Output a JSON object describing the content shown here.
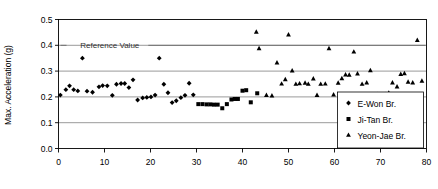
{
  "chart_data": {
    "type": "scatter",
    "title": "",
    "xlabel": "",
    "ylabel": "Max. Acceleration (g)",
    "xlim": [
      0,
      80
    ],
    "ylim": [
      0.0,
      0.5
    ],
    "xticks": [
      0,
      10,
      20,
      30,
      40,
      50,
      60,
      70,
      80
    ],
    "xtick_labels": [
      "0",
      "10",
      "20",
      "30",
      "40",
      "50",
      "60",
      "70",
      "80"
    ],
    "yticks": [
      0.0,
      0.1,
      0.2,
      0.3,
      0.4,
      0.5
    ],
    "ytick_labels": [
      "0.0",
      "0.1",
      "0.2",
      "0.3",
      "0.4",
      "0.5"
    ],
    "grid": "horizontal",
    "legend_position": "bottom-right",
    "annotations": [
      {
        "text": "Reference Value",
        "x": 3.0,
        "y": 0.4,
        "leader_to_x": 13.0,
        "leader_y": 0.4
      }
    ],
    "reference_lines": [
      {
        "label": "Reference Value",
        "y": 0.4
      }
    ],
    "series": [
      {
        "name": "E-Won Br.",
        "marker": "diamond",
        "color": "#000000",
        "points": [
          [
            0.4,
            0.207
          ],
          [
            1.6,
            0.228
          ],
          [
            2.4,
            0.243
          ],
          [
            3.3,
            0.228
          ],
          [
            4.2,
            0.223
          ],
          [
            5.2,
            0.35
          ],
          [
            6.2,
            0.222
          ],
          [
            7.4,
            0.218
          ],
          [
            8.8,
            0.239
          ],
          [
            9.6,
            0.244
          ],
          [
            10.6,
            0.243
          ],
          [
            11.7,
            0.206
          ],
          [
            12.6,
            0.249
          ],
          [
            13.6,
            0.252
          ],
          [
            14.4,
            0.252
          ],
          [
            15.3,
            0.236
          ],
          [
            16.2,
            0.266
          ],
          [
            17.2,
            0.188
          ],
          [
            18.3,
            0.196
          ],
          [
            19.2,
            0.198
          ],
          [
            20.1,
            0.2
          ],
          [
            21.0,
            0.207
          ],
          [
            21.9,
            0.35
          ],
          [
            22.9,
            0.249
          ],
          [
            23.8,
            0.216
          ],
          [
            24.7,
            0.178
          ],
          [
            25.6,
            0.185
          ],
          [
            26.6,
            0.197
          ],
          [
            27.5,
            0.206
          ],
          [
            28.4,
            0.253
          ],
          [
            29.3,
            0.208
          ]
        ]
      },
      {
        "name": "Ji-Tan Br.",
        "marker": "square",
        "color": "#000000",
        "points": [
          [
            30.4,
            0.172
          ],
          [
            31.3,
            0.172
          ],
          [
            32.2,
            0.171
          ],
          [
            33.0,
            0.171
          ],
          [
            33.8,
            0.17
          ],
          [
            34.6,
            0.17
          ],
          [
            35.6,
            0.156
          ],
          [
            36.6,
            0.172
          ],
          [
            37.6,
            0.19
          ],
          [
            38.3,
            0.192
          ],
          [
            39.0,
            0.192
          ],
          [
            40.0,
            0.224
          ],
          [
            40.8,
            0.226
          ],
          [
            41.8,
            0.179
          ],
          [
            43.2,
            0.214
          ]
        ]
      },
      {
        "name": "Yeon-Jae Br.",
        "marker": "triangle",
        "color": "#000000",
        "points": [
          [
            43.0,
            0.452
          ],
          [
            43.6,
            0.388
          ],
          [
            45.2,
            0.207
          ],
          [
            46.4,
            0.205
          ],
          [
            47.5,
            0.333
          ],
          [
            48.5,
            0.251
          ],
          [
            49.3,
            0.268
          ],
          [
            50.0,
            0.441
          ],
          [
            50.8,
            0.302
          ],
          [
            51.6,
            0.25
          ],
          [
            52.4,
            0.252
          ],
          [
            53.6,
            0.254
          ],
          [
            54.3,
            0.25
          ],
          [
            55.4,
            0.271
          ],
          [
            56.2,
            0.207
          ],
          [
            57.0,
            0.25
          ],
          [
            58.0,
            0.251
          ],
          [
            58.8,
            0.388
          ],
          [
            59.8,
            0.209
          ],
          [
            60.8,
            0.254
          ],
          [
            61.6,
            0.272
          ],
          [
            62.4,
            0.286
          ],
          [
            63.2,
            0.285
          ],
          [
            64.2,
            0.375
          ],
          [
            65.0,
            0.29
          ],
          [
            66.0,
            0.25
          ],
          [
            67.0,
            0.255
          ],
          [
            67.8,
            0.303
          ],
          [
            68.6,
            0.208
          ],
          [
            69.4,
            0.21
          ],
          [
            70.2,
            0.209
          ],
          [
            71.0,
            0.21
          ],
          [
            71.8,
            0.216
          ],
          [
            72.6,
            0.255
          ],
          [
            73.6,
            0.24
          ],
          [
            74.4,
            0.288
          ],
          [
            75.2,
            0.291
          ],
          [
            76.0,
            0.258
          ],
          [
            77.0,
            0.255
          ],
          [
            78.0,
            0.42
          ],
          [
            79.0,
            0.262
          ]
        ]
      }
    ]
  },
  "legend": {
    "items": [
      {
        "label": "E-Won Br.",
        "marker": "diamond"
      },
      {
        "label": "Ji-Tan Br.",
        "marker": "square"
      },
      {
        "label": "Yeon-Jae Br.",
        "marker": "triangle"
      }
    ]
  }
}
